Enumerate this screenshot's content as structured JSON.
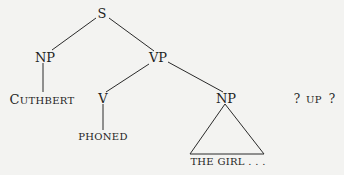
{
  "diagram": {
    "type": "syntax-tree",
    "nodes": {
      "s": {
        "label": "S"
      },
      "np_subject": {
        "label": "NP"
      },
      "vp": {
        "label": "VP"
      },
      "v": {
        "label": "V"
      },
      "np_object": {
        "label": "NP"
      },
      "cuthbert": {
        "first": "C",
        "rest": "UTHBERT"
      },
      "phoned": {
        "label": "PHONED"
      },
      "the_girl": {
        "label": "THE GIRL . . ."
      }
    },
    "extra": {
      "q1": "?",
      "up": "UP",
      "q2": "?"
    },
    "edges": [
      [
        "S",
        "NP"
      ],
      [
        "S",
        "VP"
      ],
      [
        "NP",
        "CUTHBERT"
      ],
      [
        "VP",
        "V"
      ],
      [
        "VP",
        "NP"
      ],
      [
        "V",
        "PHONED"
      ],
      [
        "NP",
        "THE GIRL . . . (triangle)"
      ]
    ],
    "colors": {
      "background": "#f3f3f1",
      "ink": "#1e1e1e"
    }
  }
}
